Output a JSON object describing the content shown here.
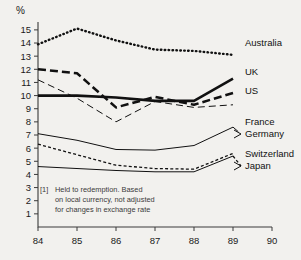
{
  "title_symbol": "%",
  "footnote": {
    "marker": "[1]",
    "line1": "Held to redemption. Based",
    "line2": "on local currency, not adjusted",
    "line3": "for changes in exchange rate"
  },
  "chart_data": {
    "type": "line",
    "title": "",
    "xlabel": "",
    "ylabel": "%",
    "x": [
      84,
      85,
      86,
      87,
      88,
      89,
      90
    ],
    "xtick_labels": [
      "84",
      "85",
      "86",
      "87",
      "88",
      "89",
      "90"
    ],
    "ytick_labels": [
      "1",
      "2",
      "3",
      "4",
      "5",
      "6",
      "7",
      "8",
      "9",
      "10",
      "11",
      "12",
      "13",
      "14",
      "15"
    ],
    "ylim": [
      0,
      15.6
    ],
    "xlim": [
      84,
      90
    ],
    "grid": false,
    "legend_position": "right-inline",
    "annotation": "[1] Held to redemption. Based on local currency, not adjusted for changes in exchange rate",
    "series": [
      {
        "name": "Australia",
        "style": "dotted",
        "label": "Australia",
        "x": [
          84,
          85,
          86,
          87,
          88,
          89
        ],
        "values": [
          13.9,
          15.1,
          14.2,
          13.5,
          13.4,
          13.1
        ]
      },
      {
        "name": "UK",
        "style": "thick-solid",
        "label": "UK",
        "x": [
          84,
          85,
          86,
          87,
          88,
          89
        ],
        "values": [
          10.0,
          10.0,
          9.85,
          9.6,
          9.6,
          11.3
        ]
      },
      {
        "name": "US",
        "style": "thick-dashed",
        "label": "US",
        "x": [
          84,
          85,
          86,
          87,
          88,
          89
        ],
        "values": [
          12.0,
          11.7,
          9.1,
          9.9,
          9.3,
          10.2
        ]
      },
      {
        "name": "France",
        "style": "thin-dashed",
        "label": "France",
        "x": [
          84,
          85,
          86,
          87,
          88,
          89
        ],
        "values": [
          11.2,
          9.8,
          8.0,
          9.55,
          9.1,
          9.3
        ]
      },
      {
        "name": "Germany",
        "style": "thin-solid",
        "label": "Germany",
        "x": [
          84,
          85,
          86,
          87,
          88,
          89
        ],
        "values": [
          7.1,
          6.6,
          5.9,
          5.85,
          6.2,
          7.6
        ]
      },
      {
        "name": "Switzerland",
        "style": "fine-dashed",
        "label": "Switzerland",
        "x": [
          84,
          85,
          86,
          87,
          88,
          89
        ],
        "values": [
          6.3,
          5.5,
          4.7,
          4.45,
          4.4,
          5.6
        ]
      },
      {
        "name": "Japan",
        "style": "thin-solid",
        "label": "Japan",
        "x": [
          84,
          85,
          86,
          87,
          88,
          89
        ],
        "values": [
          4.6,
          4.45,
          4.3,
          4.2,
          4.2,
          5.4
        ]
      }
    ]
  }
}
